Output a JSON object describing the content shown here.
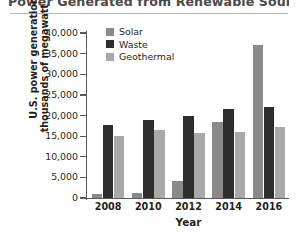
{
  "chart_data": {
    "type": "bar",
    "title": "Power Generated from Renewable Sources",
    "xlabel": "Year",
    "ylabel": "U.S. power generation (in thousands of megawatt hours)",
    "ylabel_line1": "U.S. power generation (in",
    "ylabel_line2": "thousands of megawatt hours)",
    "categories": [
      "2008",
      "2010",
      "2012",
      "2014",
      "2016"
    ],
    "series": [
      {
        "name": "Solar",
        "color": "#8a8a8a",
        "values": [
          900,
          1300,
          4200,
          18500,
          37000
        ]
      },
      {
        "name": "Waste",
        "color": "#2d2d2d",
        "values": [
          17800,
          19000,
          20000,
          21500,
          22000
        ]
      },
      {
        "name": "Geothermal",
        "color": "#a9a9a9",
        "values": [
          15000,
          16500,
          15800,
          16000,
          17300
        ]
      }
    ],
    "ylim": [
      0,
      40000
    ],
    "ytick_step": 5000,
    "yticks": [
      0,
      5000,
      10000,
      15000,
      20000,
      25000,
      30000,
      35000,
      40000
    ],
    "ytick_labels": [
      "0",
      "5,000",
      "10,000",
      "15,000",
      "20,000",
      "25,000",
      "30,000",
      "35,000",
      "40,000"
    ],
    "grid": false,
    "legend_position": "top-left-inside"
  }
}
